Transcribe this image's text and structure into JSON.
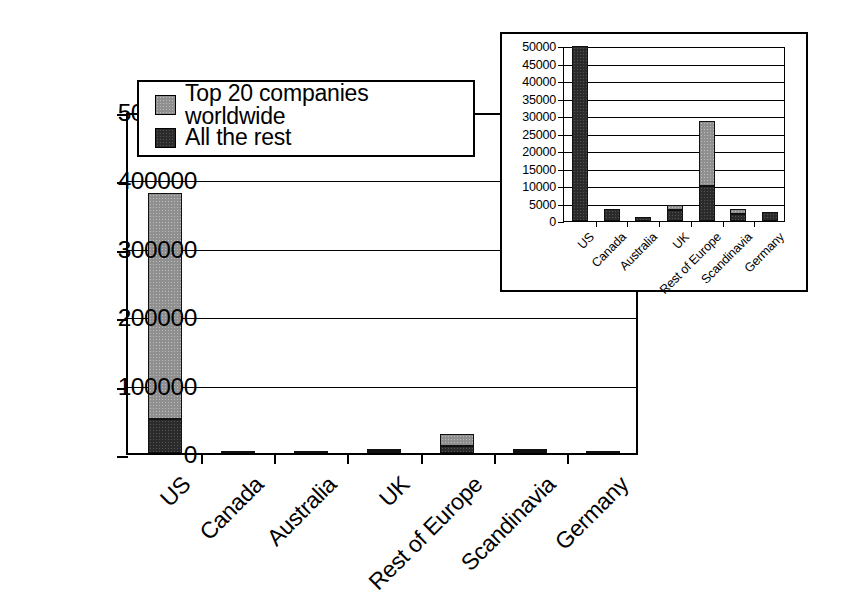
{
  "legend": {
    "entries": [
      {
        "label": "Top 20 companies worldwide",
        "key": "top20",
        "color": "#8f8f8f"
      },
      {
        "label": "All the rest",
        "key": "rest",
        "color": "#2b2b2b"
      }
    ]
  },
  "chart_data": [
    {
      "id": "main",
      "type": "bar",
      "stacked": true,
      "title": "",
      "xlabel": "",
      "ylabel": "",
      "ylim": [
        0,
        500000
      ],
      "yticks": [
        0,
        100000,
        200000,
        300000,
        400000,
        500000
      ],
      "ytick_labels": [
        "0",
        "100000",
        "200000",
        "300000",
        "400000",
        "500000"
      ],
      "grid": true,
      "legend_position": "upper-left-inside",
      "categories": [
        "US",
        "Canada",
        "Australia",
        "UK",
        "Rest of Europe",
        "Scandinavia",
        "Germany"
      ],
      "series": [
        {
          "name": "All the rest",
          "color": "#2b2b2b",
          "values": [
            50000,
            3500,
            1200,
            5000,
            10000,
            3000,
            2500
          ]
        },
        {
          "name": "Top 20 companies worldwide",
          "color": "#8f8f8f",
          "values": [
            330000,
            0,
            0,
            1500,
            18500,
            500,
            0
          ]
        }
      ],
      "totals": [
        380000,
        3500,
        1200,
        6500,
        28500,
        3500,
        2500
      ]
    },
    {
      "id": "inset",
      "type": "bar",
      "stacked": true,
      "title": "",
      "xlabel": "",
      "ylabel": "",
      "ylim": [
        0,
        50000
      ],
      "yticks": [
        0,
        5000,
        10000,
        15000,
        20000,
        25000,
        30000,
        35000,
        40000,
        45000,
        50000
      ],
      "ytick_labels": [
        "0",
        "5000",
        "10000",
        "15000",
        "20000",
        "25000",
        "30000",
        "35000",
        "40000",
        "45000",
        "50000"
      ],
      "grid": true,
      "categories": [
        "US",
        "Canada",
        "Australia",
        "UK",
        "Rest of Europe",
        "Scandinavia",
        "Germany"
      ],
      "series": [
        {
          "name": "All the rest",
          "color": "#2b2b2b",
          "values": [
            50000,
            3500,
            1200,
            3200,
            10000,
            2000,
            2500
          ]
        },
        {
          "name": "Top 20 companies worldwide",
          "color": "#8f8f8f",
          "values": [
            0,
            0,
            0,
            1300,
            18500,
            1500,
            0
          ]
        }
      ],
      "totals": [
        50000,
        3500,
        1200,
        4500,
        28500,
        3500,
        2500
      ]
    }
  ]
}
